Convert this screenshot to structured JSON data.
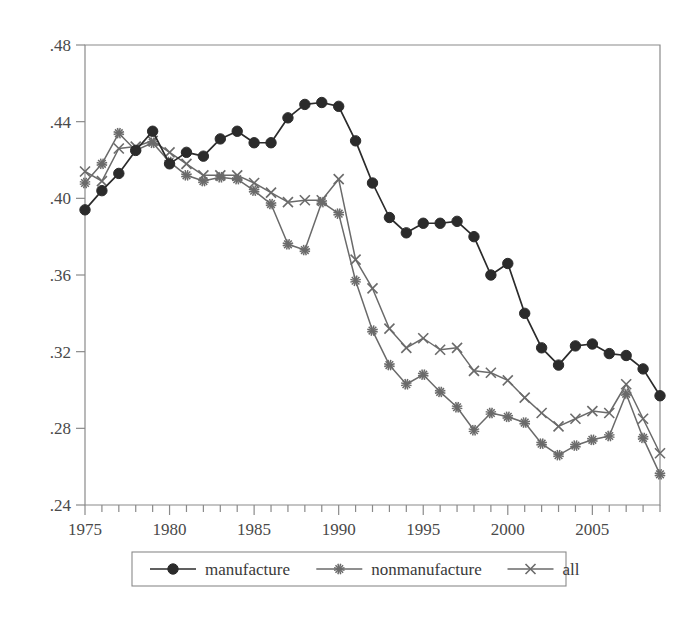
{
  "chart_data": {
    "type": "line",
    "title": "",
    "subtitle": "",
    "xlabel": "",
    "ylabel": "",
    "xlim": [
      1975,
      2009
    ],
    "ylim": [
      0.24,
      0.48
    ],
    "grid": false,
    "legend_position": "bottom-center",
    "x": [
      1975,
      1976,
      1977,
      1978,
      1979,
      1980,
      1981,
      1982,
      1983,
      1984,
      1985,
      1986,
      1987,
      1988,
      1989,
      1990,
      1991,
      1992,
      1993,
      1994,
      1995,
      1996,
      1997,
      1998,
      1999,
      2000,
      2001,
      2002,
      2003,
      2004,
      2005,
      2006,
      2007,
      2008,
      2009
    ],
    "x_tick_labels": [
      "1975",
      "1980",
      "1985",
      "1990",
      "1995",
      "2000",
      "2005"
    ],
    "x_tick_values": [
      1975,
      1980,
      1985,
      1990,
      1995,
      2000,
      2005
    ],
    "y_tick_labels": [
      ".24",
      ".28",
      ".32",
      ".36",
      ".40",
      ".44",
      ".48"
    ],
    "y_tick_values": [
      0.24,
      0.28,
      0.32,
      0.36,
      0.4,
      0.44,
      0.48
    ],
    "series": [
      {
        "name": "manufacture",
        "marker": "filled-circle",
        "color": "#2b2b2b",
        "values": [
          0.394,
          0.404,
          0.413,
          0.425,
          0.435,
          0.418,
          0.424,
          0.422,
          0.431,
          0.435,
          0.429,
          0.429,
          0.442,
          0.449,
          0.45,
          0.448,
          0.43,
          0.408,
          0.39,
          0.382,
          0.387,
          0.387,
          0.388,
          0.38,
          0.36,
          0.366,
          0.34,
          0.322,
          0.313,
          0.323,
          0.324,
          0.319,
          0.318,
          0.311,
          0.297
        ]
      },
      {
        "name": "nonmanufacture",
        "marker": "star",
        "color": "#6a6a6a",
        "values": [
          0.408,
          0.418,
          0.434,
          0.425,
          0.429,
          0.419,
          0.412,
          0.409,
          0.411,
          0.41,
          0.404,
          0.397,
          0.376,
          0.373,
          0.398,
          0.392,
          0.357,
          0.331,
          0.313,
          0.303,
          0.308,
          0.299,
          0.291,
          0.279,
          0.288,
          0.286,
          0.283,
          0.272,
          0.266,
          0.271,
          0.274,
          0.276,
          0.298,
          0.275,
          0.256
        ]
      },
      {
        "name": "all",
        "marker": "cross",
        "color": "#6a6a6a",
        "values": [
          0.414,
          0.409,
          0.426,
          0.427,
          0.43,
          0.424,
          0.418,
          0.412,
          0.412,
          0.412,
          0.408,
          0.403,
          0.398,
          0.399,
          0.399,
          0.41,
          0.368,
          0.353,
          0.332,
          0.322,
          0.327,
          0.321,
          0.322,
          0.31,
          0.309,
          0.305,
          0.296,
          0.288,
          0.281,
          0.285,
          0.289,
          0.288,
          0.303,
          0.285,
          0.267
        ]
      }
    ]
  },
  "legend": {
    "items": [
      {
        "label": "manufacture",
        "marker": "filled-circle"
      },
      {
        "label": "nonmanufacture",
        "marker": "star"
      },
      {
        "label": "all",
        "marker": "cross"
      }
    ]
  },
  "colors": {
    "axis": "#8a8a8a",
    "manufacture": "#2b2b2b",
    "nonmanufacture": "#6a6a6a",
    "all": "#6a6a6a",
    "background": "#ffffff"
  }
}
